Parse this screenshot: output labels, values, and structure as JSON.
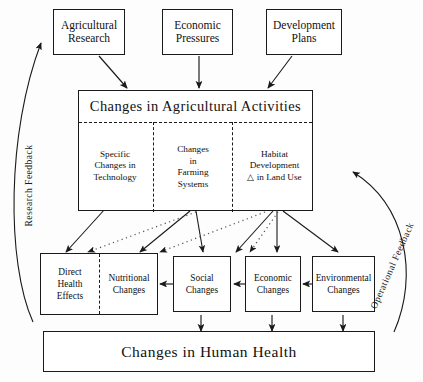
{
  "diagram": {
    "title_center": "Changes in Agricultural Activities",
    "title_bottom": "Changes in Human Health",
    "sources": [
      {
        "id": "agricultural-research",
        "label": "Agricultural\nResearch"
      },
      {
        "id": "economic-pressures",
        "label": "Economic\nPressures"
      },
      {
        "id": "development-plans",
        "label": "Development\nPlans"
      }
    ],
    "central_cells": [
      {
        "id": "specific-changes-technology",
        "label": "Specific\nChanges in\nTechnology"
      },
      {
        "id": "changes-farming-systems",
        "label": "Changes\nin\nFarming\nSystems"
      },
      {
        "id": "habitat-development",
        "label": "Habitat\nDevelopment\n△ in Land Use"
      }
    ],
    "outcomes": [
      {
        "id": "direct-health-effects",
        "label": "Direct\nHealth\nEffects"
      },
      {
        "id": "nutritional-changes",
        "label": "Nutritional\nChanges"
      },
      {
        "id": "social-changes",
        "label": "Social\nChanges"
      },
      {
        "id": "economic-changes",
        "label": "Economic\nChanges"
      },
      {
        "id": "environmental-changes",
        "label": "Environmental\nChanges"
      }
    ],
    "feedback_labels": {
      "left": "Research Feedback",
      "right": "Operational Feedback"
    },
    "colors": {
      "stroke": "#1a1a1a",
      "background": "#ffffff",
      "dotted": "#555555"
    }
  }
}
